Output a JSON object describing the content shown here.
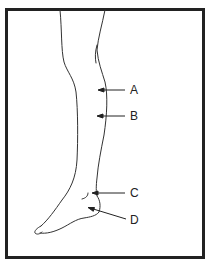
{
  "figure": {
    "border_color": "#222222",
    "line_color": "#333333",
    "labels": [
      {
        "id": "A",
        "text": "A",
        "x": 130,
        "y": 84
      },
      {
        "id": "B",
        "text": "B",
        "x": 130,
        "y": 110
      },
      {
        "id": "C",
        "text": "C",
        "x": 130,
        "y": 187
      },
      {
        "id": "D",
        "text": "D",
        "x": 130,
        "y": 214
      }
    ]
  }
}
